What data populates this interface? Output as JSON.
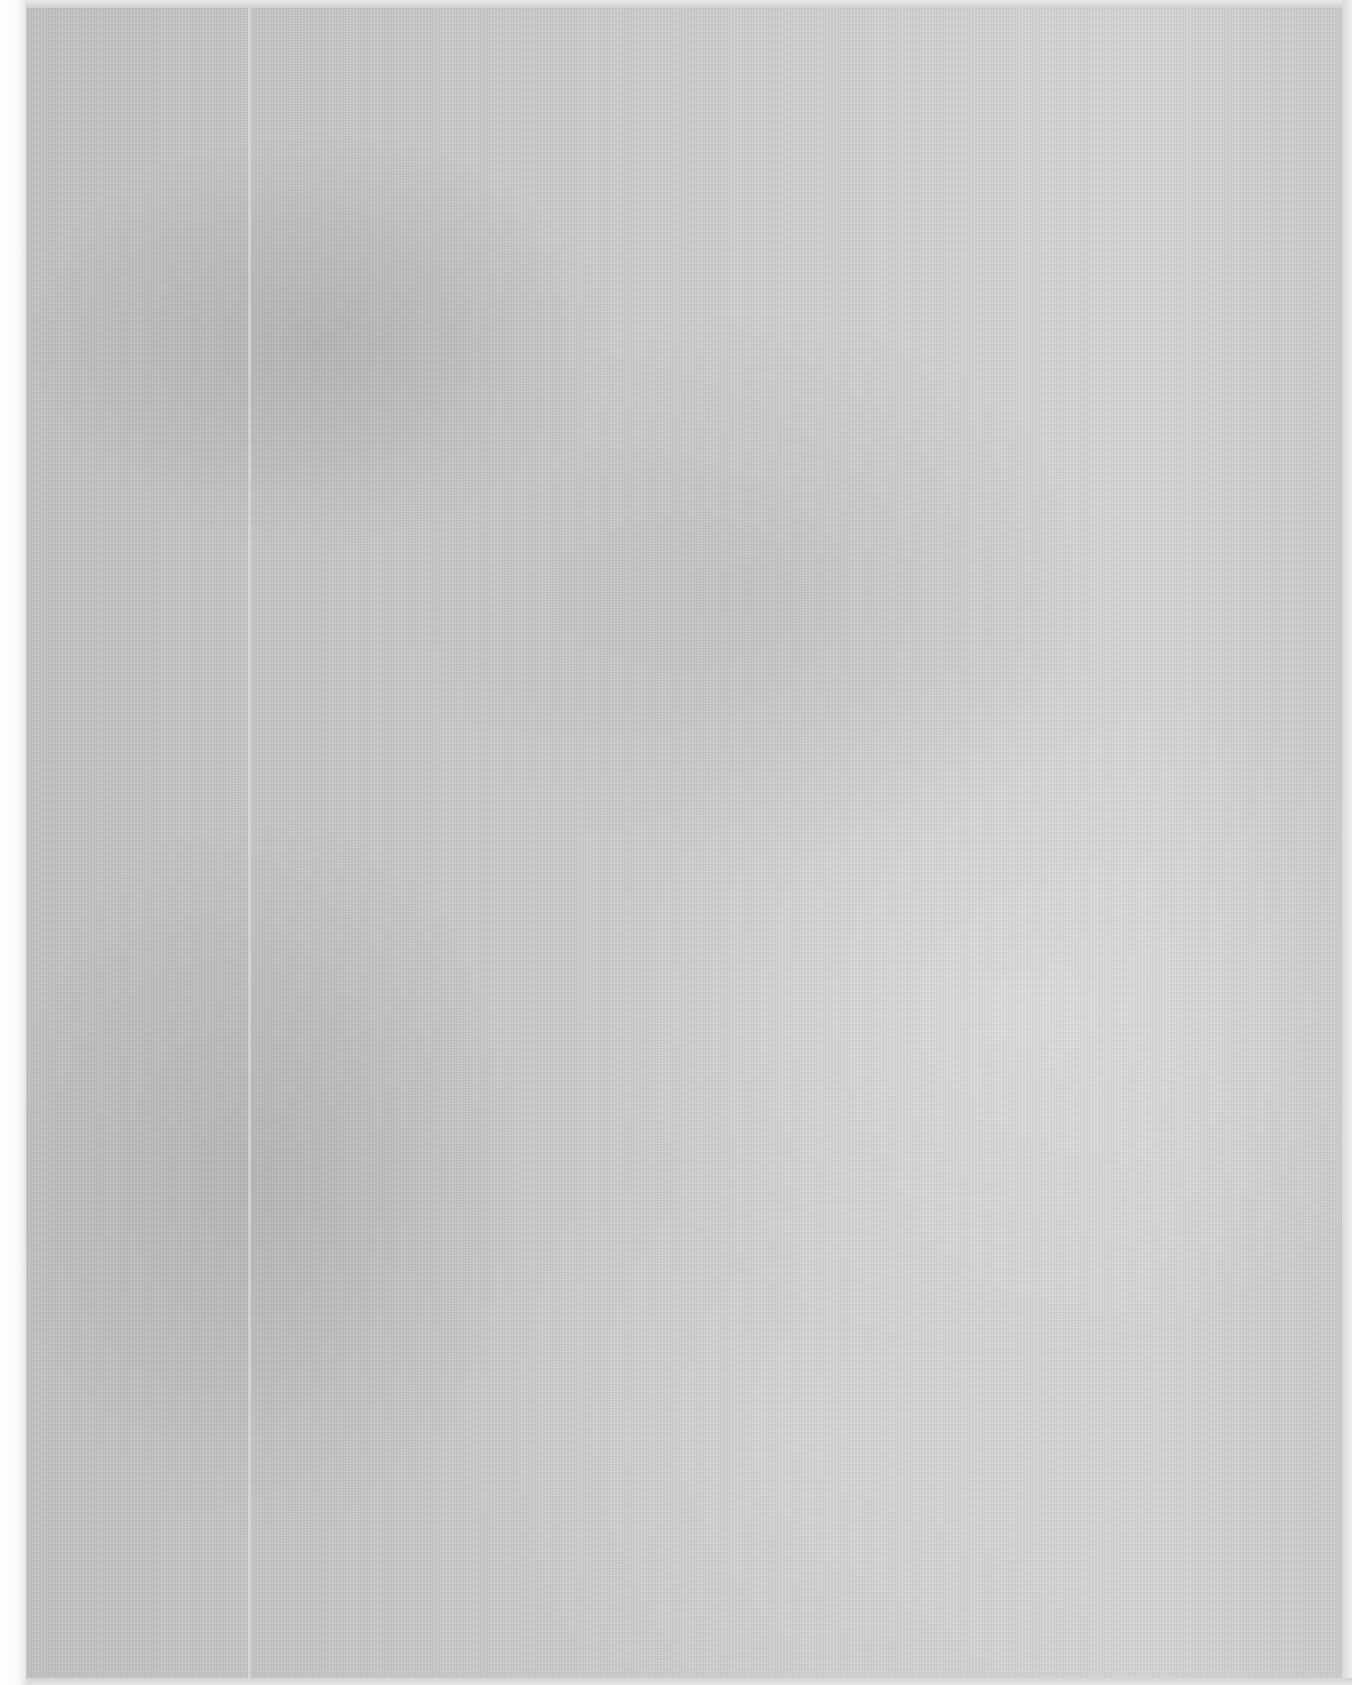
{
  "document": {
    "type": "scanned-page",
    "content": "",
    "colors": {
      "paper": "#cdcdcd",
      "margin": "#ffffff",
      "edge": "#e6e6e6"
    }
  }
}
